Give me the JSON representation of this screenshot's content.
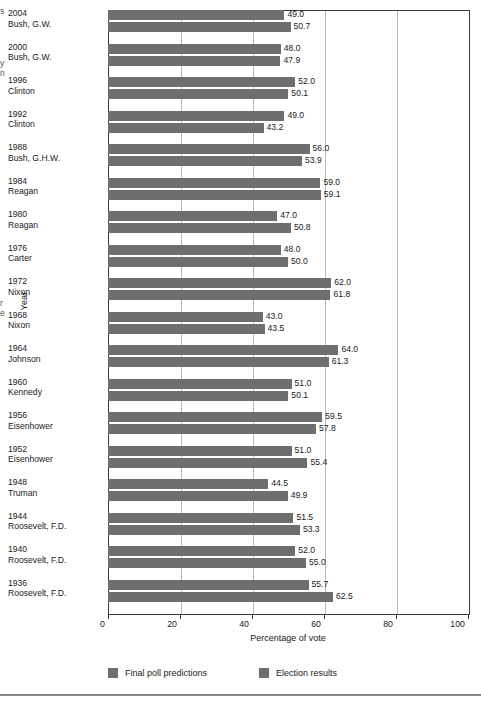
{
  "margin_fragments": [
    {
      "text": "s",
      "top": 6
    },
    {
      "text": "y",
      "top": 58
    },
    {
      "text": "n",
      "top": 68
    },
    {
      "text": "r",
      "top": 298
    },
    {
      "text": "e",
      "top": 308
    }
  ],
  "axes": {
    "y_title": "Year",
    "x_title": "Percentage of vote",
    "x_ticks": [
      "0",
      "20",
      "40",
      "60",
      "80",
      "100"
    ]
  },
  "legend": {
    "items": [
      {
        "label": "Final poll predictions",
        "color": "#6e6e6e"
      },
      {
        "label": "Election results",
        "color": "#6e6e6e"
      }
    ]
  },
  "colors": {
    "bar": "#6e6e6e",
    "axis": "#3a3a3a",
    "grid": "#b9b9b9",
    "footer_rule": "#8a8a8a"
  },
  "chart_data": {
    "type": "bar",
    "orientation": "horizontal",
    "title": "",
    "xlabel": "Percentage of vote",
    "ylabel": "Year",
    "xlim": [
      0,
      100
    ],
    "xticks": [
      0,
      20,
      40,
      60,
      80,
      100
    ],
    "grid": true,
    "legend_position": "bottom-left",
    "categories": [
      "2004 Bush, G.W.",
      "2000 Bush, G.W.",
      "1996 Clinton",
      "1992 Clinton",
      "1988 Bush, G.H.W.",
      "1984 Reagan",
      "1980 Reagan",
      "1976 Carter",
      "1972 Nixon",
      "1968 Nixon",
      "1964 Johnson",
      "1960 Kennedy",
      "1956 Eisenhower",
      "1952 Eisenhower",
      "1948 Truman",
      "1944 Roosevelt, F.D.",
      "1940 Roosevelt, F.D.",
      "1936 Roosevelt, F.D."
    ],
    "series": [
      {
        "name": "Final poll predictions",
        "values": [
          49.0,
          48.0,
          52.0,
          49.0,
          56.0,
          59.0,
          47.0,
          48.0,
          62.0,
          43.0,
          64.0,
          51.0,
          59.5,
          51.0,
          44.5,
          51.5,
          52.0,
          55.7
        ]
      },
      {
        "name": "Election results",
        "values": [
          50.7,
          47.9,
          50.1,
          43.2,
          53.9,
          59.1,
          50.8,
          50.0,
          61.8,
          43.5,
          61.3,
          50.1,
          57.8,
          55.4,
          49.9,
          53.3,
          55.0,
          62.5
        ]
      }
    ]
  },
  "rows": [
    {
      "year": "2004",
      "name": "Bush, G.W.",
      "poll": "49.0",
      "poll_v": 49.0,
      "result": "50.7",
      "result_v": 50.7
    },
    {
      "year": "2000",
      "name": "Bush, G.W.",
      "poll": "48.0",
      "poll_v": 48.0,
      "result": "47.9",
      "result_v": 47.9
    },
    {
      "year": "1996",
      "name": "Clinton",
      "poll": "52.0",
      "poll_v": 52.0,
      "result": "50.1",
      "result_v": 50.1
    },
    {
      "year": "1992",
      "name": "Clinton",
      "poll": "49.0",
      "poll_v": 49.0,
      "result": "43.2",
      "result_v": 43.2
    },
    {
      "year": "1988",
      "name": "Bush, G.H.W.",
      "poll": "56.0",
      "poll_v": 56.0,
      "result": "53.9",
      "result_v": 53.9
    },
    {
      "year": "1984",
      "name": "Reagan",
      "poll": "59.0",
      "poll_v": 59.0,
      "result": "59.1",
      "result_v": 59.1
    },
    {
      "year": "1980",
      "name": "Reagan",
      "poll": "47.0",
      "poll_v": 47.0,
      "result": "50.8",
      "result_v": 50.8
    },
    {
      "year": "1976",
      "name": "Carter",
      "poll": "48.0",
      "poll_v": 48.0,
      "result": "50.0",
      "result_v": 50.0
    },
    {
      "year": "1972",
      "name": "Nixon",
      "poll": "62.0",
      "poll_v": 62.0,
      "result": "61.8",
      "result_v": 61.8
    },
    {
      "year": "1968",
      "name": "Nixon",
      "poll": "43.0",
      "poll_v": 43.0,
      "result": "43.5",
      "result_v": 43.5
    },
    {
      "year": "1964",
      "name": "Johnson",
      "poll": "64.0",
      "poll_v": 64.0,
      "result": "61.3",
      "result_v": 61.3
    },
    {
      "year": "1960",
      "name": "Kennedy",
      "poll": "51.0",
      "poll_v": 51.0,
      "result": "50.1",
      "result_v": 50.1
    },
    {
      "year": "1956",
      "name": "Eisenhower",
      "poll": "59.5",
      "poll_v": 59.5,
      "result": "57.8",
      "result_v": 57.8
    },
    {
      "year": "1952",
      "name": "Eisenhower",
      "poll": "51.0",
      "poll_v": 51.0,
      "result": "55.4",
      "result_v": 55.4
    },
    {
      "year": "1948",
      "name": "Truman",
      "poll": "44.5",
      "poll_v": 44.5,
      "result": "49.9",
      "result_v": 49.9
    },
    {
      "year": "1944",
      "name": "Roosevelt, F.D.",
      "poll": "51.5",
      "poll_v": 51.5,
      "result": "53.3",
      "result_v": 53.3
    },
    {
      "year": "1940",
      "name": "Roosevelt, F.D.",
      "poll": "52.0",
      "poll_v": 52.0,
      "result": "55.0",
      "result_v": 55.0
    },
    {
      "year": "1936",
      "name": "Roosevelt, F.D.",
      "poll": "55.7",
      "poll_v": 55.7,
      "result": "62.5",
      "result_v": 62.5
    }
  ]
}
